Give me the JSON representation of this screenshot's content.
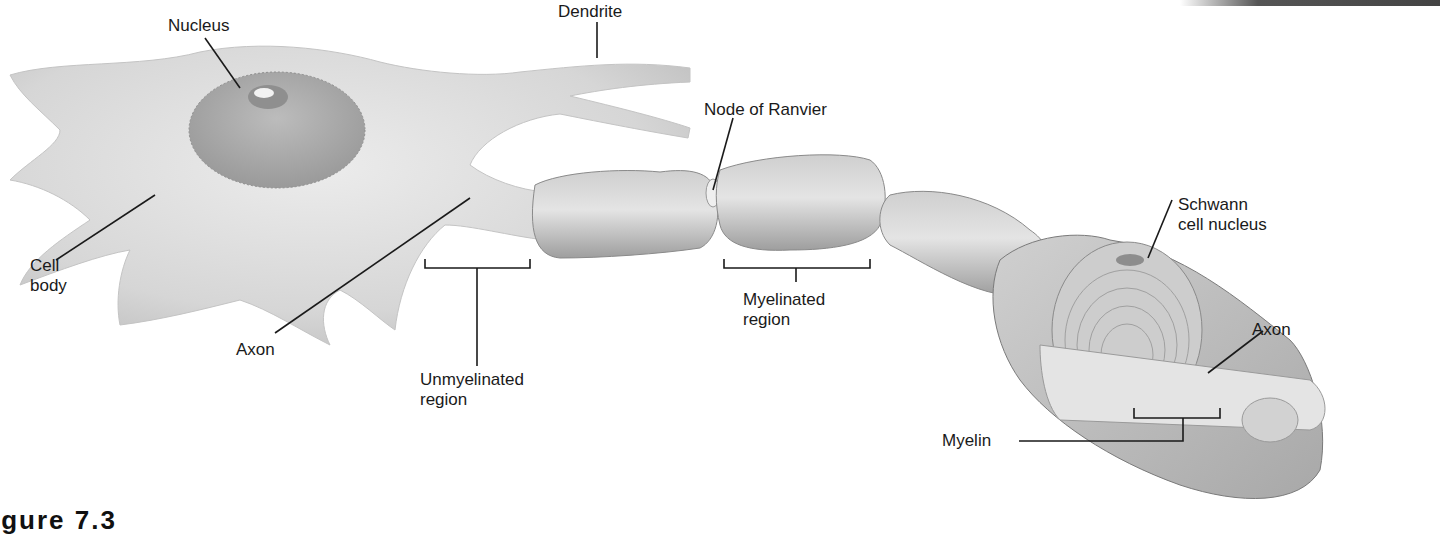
{
  "figure": {
    "caption_partial": "igure 7.3"
  },
  "labels": {
    "nucleus": "Nucleus",
    "dendrite": "Dendrite",
    "node_of_ranvier": "Node of Ranvier",
    "cell_body": "Cell\nbody",
    "axon_left": "Axon",
    "unmyelinated_region": "Unmyelinated\nregion",
    "myelinated_region": "Myelinated\nregion",
    "schwann_cell_nucleus": "Schwann\ncell nucleus",
    "axon_right": "Axon",
    "myelin": "Myelin"
  },
  "colors": {
    "background": "#ffffff",
    "cell_fill": "#dcdcdc",
    "cell_shade": "#b8b8b8",
    "nucleus_fill": "#a9a9a9",
    "myelin_fill": "#bdbdbd",
    "leader_line": "#1a1a1a",
    "text": "#1a1a1a"
  }
}
